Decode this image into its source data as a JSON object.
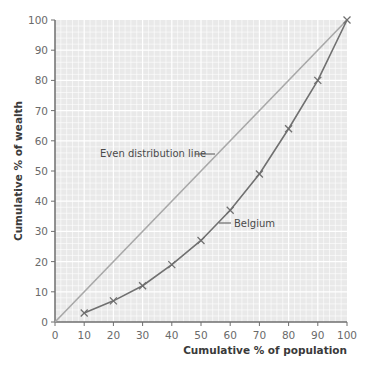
{
  "chart_data": {
    "type": "line",
    "title": "",
    "xlabel": "Cumulative % of population",
    "ylabel": "Cumulative % of wealth",
    "xlim": [
      0,
      100
    ],
    "ylim": [
      0,
      100
    ],
    "x_ticks": [
      0,
      10,
      20,
      30,
      40,
      50,
      60,
      70,
      80,
      90,
      100
    ],
    "y_ticks": [
      0,
      10,
      20,
      30,
      40,
      50,
      60,
      70,
      80,
      90,
      100
    ],
    "grid": true,
    "legend": "none",
    "series": [
      {
        "name": "Even distribution line",
        "x": [
          0,
          100
        ],
        "y": [
          0,
          100
        ],
        "color": "#a8a8a8",
        "markers": false
      },
      {
        "name": "Belgium",
        "x": [
          10,
          20,
          30,
          40,
          50,
          60,
          70,
          80,
          90,
          100
        ],
        "y": [
          3,
          7,
          12,
          19,
          27,
          37,
          49,
          64,
          80,
          100
        ],
        "color": "#707070",
        "markers": true
      }
    ],
    "annotations": [
      {
        "text": "Even distribution line",
        "points_to": "Even distribution line"
      },
      {
        "text": "Belgium",
        "points_to": "Belgium"
      }
    ]
  },
  "labels": {
    "xlabel": "Cumulative % of population",
    "ylabel": "Cumulative % of wealth",
    "even_line": "Even distribution line",
    "belgium": "Belgium"
  },
  "colors": {
    "plot_bg": "#e9e9e9",
    "grid": "#ffffff",
    "axis": "#6e6e6e",
    "even_line": "#a8a8a8",
    "curve": "#707070"
  }
}
